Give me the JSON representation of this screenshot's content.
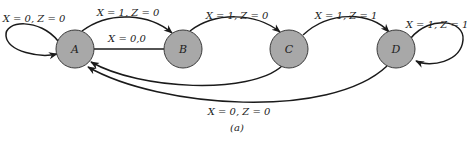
{
  "diagram": {
    "type": "state-diagram",
    "caption": "(a)",
    "colors": {
      "node_fill": "#a8a8a8",
      "node_stroke": "#3a3a3a",
      "edge": "#1a1a1a",
      "background": "#ffffff"
    },
    "nodes": [
      {
        "id": "A",
        "label": "A"
      },
      {
        "id": "B",
        "label": "B"
      },
      {
        "id": "C",
        "label": "C"
      },
      {
        "id": "D",
        "label": "D"
      }
    ],
    "edges": [
      {
        "from": "A",
        "to": "A",
        "label": "X = 0, Z = 0"
      },
      {
        "from": "A",
        "to": "B",
        "label": "X = 1, Z = 0"
      },
      {
        "from": "B",
        "to": "A",
        "label": "X = 0,0"
      },
      {
        "from": "B",
        "to": "C",
        "label": "X = 1, Z = 0"
      },
      {
        "from": "C",
        "to": "D",
        "label": "X = 1, Z = 1"
      },
      {
        "from": "D",
        "to": "D",
        "label": "X = 1, Z = 1"
      },
      {
        "from": "C",
        "to": "A",
        "label": ""
      },
      {
        "from": "D",
        "to": "A",
        "label": "X = 0, Z = 0"
      }
    ]
  }
}
